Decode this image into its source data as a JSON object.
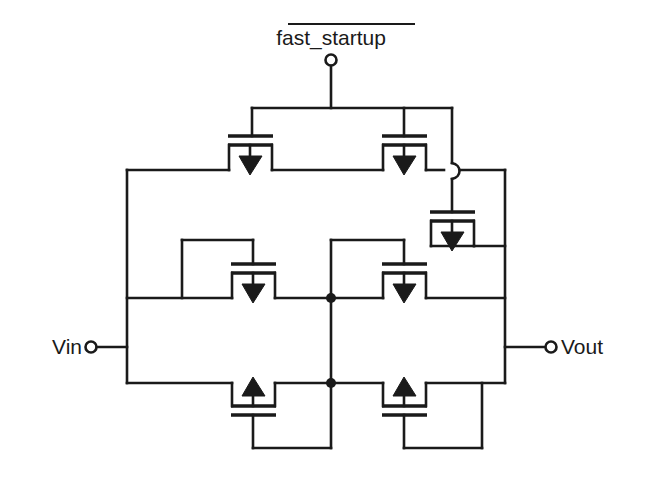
{
  "diagram": {
    "background_color": "#ffffff",
    "line_color": "#1a1a1a"
  },
  "labels": {
    "control_signal": "fast_startup",
    "control_signal_active_low": true,
    "input_terminal": "Vin",
    "output_terminal": "Vout"
  },
  "terminals": [
    {
      "name": "control",
      "label": "fast_startup",
      "x": 331,
      "y": 60
    },
    {
      "name": "input",
      "label": "Vin",
      "x": 91,
      "y": 347
    },
    {
      "name": "output",
      "label": "Vout",
      "x": 551,
      "y": 347
    }
  ],
  "transistors": [
    {
      "id": "M1",
      "role": "top-left-pmos",
      "arrow": "down",
      "orientation": "gate-top",
      "cx": 250,
      "cy": 140
    },
    {
      "id": "M2",
      "role": "top-right-pmos",
      "arrow": "down",
      "orientation": "gate-top",
      "cx": 404,
      "cy": 140
    },
    {
      "id": "M3",
      "role": "right-pmos",
      "arrow": "down",
      "orientation": "gate-top",
      "cx": 452,
      "cy": 216
    },
    {
      "id": "M4",
      "role": "mid-left-pmos",
      "arrow": "down",
      "orientation": "gate-top",
      "cx": 253,
      "cy": 268
    },
    {
      "id": "M5",
      "role": "mid-right-pmos",
      "arrow": "down",
      "orientation": "gate-top",
      "cx": 404,
      "cy": 268
    },
    {
      "id": "M6",
      "role": "bottom-left-nmos",
      "arrow": "up",
      "orientation": "gate-bottom",
      "cx": 253,
      "cy": 412
    },
    {
      "id": "M7",
      "role": "bottom-right-nmos",
      "arrow": "up",
      "orientation": "gate-bottom",
      "cx": 404,
      "cy": 412
    }
  ],
  "junctions": [
    {
      "name": "center-node-upper",
      "x": 331,
      "y": 298
    },
    {
      "name": "center-node-lower",
      "x": 331,
      "y": 383
    }
  ],
  "nets": {
    "left_rail": "Vin node (x=127)",
    "right_rail": "Vout node (x=505)",
    "center_node": "internal node (x=331)",
    "gate_bus": "fast_startup gate bus (y=108)"
  }
}
